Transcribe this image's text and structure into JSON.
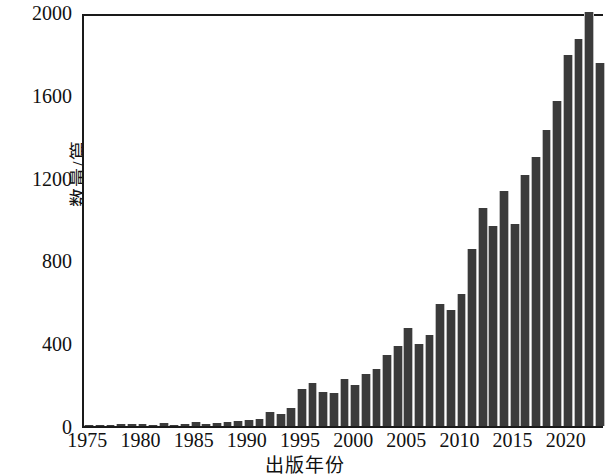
{
  "chart_data": {
    "type": "bar",
    "title": "",
    "xlabel": "出版年份",
    "ylabel": "数量/篇",
    "xlim": [
      1974.5,
      2023.5
    ],
    "ylim": [
      0,
      2000
    ],
    "grid": false,
    "legend": null,
    "ytick_labels": [
      "0",
      "400",
      "800",
      "1200",
      "1600",
      "2000"
    ],
    "ytick_values": [
      0,
      400,
      800,
      1200,
      1600,
      2000
    ],
    "xtick_labels": [
      "1975",
      "1980",
      "1985",
      "1990",
      "1995",
      "2000",
      "2005",
      "2010",
      "2015",
      "2020"
    ],
    "xtick_values": [
      1975,
      1980,
      1985,
      1990,
      1995,
      2000,
      2005,
      2010,
      2015,
      2020
    ],
    "bar_color": "#3b3b3b",
    "bar_edge_color": "#bdbdbd",
    "axis_color": "#1a1a1a",
    "categories": [
      1975,
      1976,
      1977,
      1978,
      1979,
      1980,
      1981,
      1982,
      1983,
      1984,
      1985,
      1986,
      1987,
      1988,
      1989,
      1990,
      1991,
      1992,
      1993,
      1994,
      1995,
      1996,
      1997,
      1998,
      1999,
      2000,
      2001,
      2002,
      2003,
      2004,
      2005,
      2006,
      2007,
      2008,
      2009,
      2010,
      2011,
      2012,
      2013,
      2014,
      2015,
      2016,
      2017,
      2018,
      2019,
      2020,
      2021,
      2022,
      2023
    ],
    "values": [
      2,
      3,
      4,
      10,
      8,
      9,
      6,
      14,
      6,
      9,
      19,
      11,
      16,
      18,
      22,
      29,
      32,
      66,
      57,
      86,
      180,
      208,
      165,
      160,
      225,
      197,
      250,
      275,
      345,
      385,
      475,
      395,
      440,
      590,
      560,
      640,
      855,
      1055,
      965,
      1135,
      975,
      1215,
      1300,
      1430,
      1570,
      1790,
      1870,
      2000,
      1755
    ]
  }
}
